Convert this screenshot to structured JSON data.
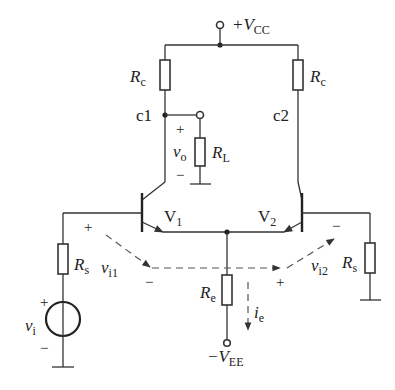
{
  "diagram": {
    "type": "differential-amplifier-circuit",
    "supply": {
      "pos_label_prefix": "+V",
      "pos_label_sub": "CC",
      "neg_label_prefix": "−V",
      "neg_label_sub": "EE"
    },
    "resistors": {
      "rc_left": {
        "sym": "R",
        "sub": "c"
      },
      "rc_right": {
        "sym": "R",
        "sub": "c"
      },
      "rl": {
        "sym": "R",
        "sub": "L"
      },
      "rs_left": {
        "sym": "R",
        "sub": "s"
      },
      "rs_right": {
        "sym": "R",
        "sub": "s"
      },
      "re": {
        "sym": "R",
        "sub": "e"
      }
    },
    "nodes": {
      "c1": "c1",
      "c2": "c2"
    },
    "transistors": {
      "v1": {
        "sym": "V",
        "sub": "1"
      },
      "v2": {
        "sym": "V",
        "sub": "2"
      }
    },
    "signals": {
      "vo": {
        "sym": "v",
        "sub": "o"
      },
      "vi": {
        "sym": "v",
        "sub": "i"
      },
      "vi1": {
        "sym": "v",
        "sub": "i1"
      },
      "vi2": {
        "sym": "v",
        "sub": "i2"
      },
      "ie": {
        "sym": "i",
        "sub": "e"
      }
    },
    "polarity": {
      "plus": "+",
      "minus": "−"
    },
    "colors": {
      "line": "#333333",
      "dashed": "#555555",
      "background": "#ffffff"
    }
  }
}
